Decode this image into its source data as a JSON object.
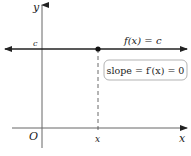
{
  "diagram": {
    "axes": {
      "x_label": "x",
      "y_label": "y",
      "origin_label": "O",
      "x_tick_label": "x",
      "y_tick_label": "c"
    },
    "function_label": "f(x) = c",
    "slope_box": "slope = f′(x) = 0",
    "colors": {
      "axis": "#555555",
      "function_line": "#222222",
      "box_border": "#999999"
    }
  }
}
